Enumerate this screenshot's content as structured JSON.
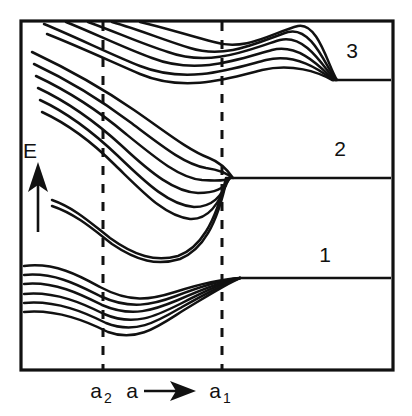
{
  "figure": {
    "type": "energy-band-splitting-diagram",
    "background_color": "#ffffff",
    "line_color": "#111111"
  },
  "axes": {
    "y_axis": {
      "label": "E",
      "description": "Energy increasing upward",
      "arrow_direction": "up"
    },
    "x_axis": {
      "label": "a",
      "description": "Interatomic spacing increasing to the right",
      "arrow_direction": "right",
      "ticks": [
        {
          "label": "a",
          "subscript": "2",
          "x": 103
        },
        {
          "label": "a",
          "subscript": "1",
          "x": 222
        }
      ]
    }
  },
  "band_labels": [
    {
      "text": "3",
      "x": 352,
      "y": 58
    },
    {
      "text": "2",
      "x": 340,
      "y": 156
    },
    {
      "text": "1",
      "x": 325,
      "y": 262
    }
  ],
  "markers": {
    "dashed_vertical_lines": [
      {
        "name": "a2",
        "x": 103
      },
      {
        "name": "a1",
        "x": 222
      }
    ]
  },
  "chart_data": {
    "type": "line",
    "title": "",
    "xlabel": "a",
    "ylabel": "E",
    "grid": false,
    "legend": "none",
    "plot_area": {
      "x0": 21,
      "y0": 21,
      "x1": 393,
      "y1": 370
    },
    "annotations": [
      {
        "text": "3",
        "x": 352,
        "y": 58
      },
      {
        "text": "2",
        "x": 340,
        "y": 156
      },
      {
        "text": "1",
        "x": 325,
        "y": 262
      },
      {
        "text": "a2",
        "x": 103,
        "y": 392
      },
      {
        "text": "a",
        "x": 140,
        "y": 392
      },
      {
        "text": "a1",
        "x": 222,
        "y": 392
      },
      {
        "text": "E",
        "x": 37,
        "y": 152
      }
    ],
    "series": [
      {
        "name": "band-1-level-1",
        "path": "M 24,266 C 55,262 80,276 100,287 C 130,303 150,300 175,292 C 200,284 222,279 240,278"
      },
      {
        "name": "band-1-level-2",
        "path": "M 24,275 C 55,272 80,286 100,296 C 130,310 152,305 176,296 C 202,286 222,280 240,278"
      },
      {
        "name": "band-1-level-3",
        "path": "M 24,284 C 55,281 82,295 102,305 C 132,318 154,310 178,300 C 203,289 223,281 240,278"
      },
      {
        "name": "band-1-level-4",
        "path": "M 24,294 C 56,291 84,304 104,314 C 134,327 156,316 180,304 C 205,291 224,282 240,278"
      },
      {
        "name": "band-1-level-5",
        "path": "M 24,303 C 57,300 86,313 106,323 C 136,335 158,321 182,307 C 207,293 225,283 240,278"
      },
      {
        "name": "band-1-level-6",
        "path": "M 24,312 C 58,309 88,322 108,332 C 138,343 160,325 184,310 C 209,295 226,284 240,278"
      },
      {
        "name": "band-2-lower-pair-a",
        "path": "M 52,200 C 75,208 92,224 110,238 C 135,256 155,262 178,256 C 200,248 215,224 226,178"
      },
      {
        "name": "band-2-lower-pair-b",
        "path": "M 52,206 C 76,214 94,230 112,244 C 137,261 157,266 180,259 C 202,250 217,226 227,178"
      },
      {
        "name": "band-2-level-1",
        "path": "M 42,112 C 70,125 95,145 115,165 C 145,194 165,216 190,219 C 208,220 220,204 228,178"
      },
      {
        "name": "band-2-level-2",
        "path": "M 40,100 C 70,114 96,135 118,156 C 148,185 170,205 194,207 C 212,207 222,197 229,178"
      },
      {
        "name": "band-2-level-3",
        "path": "M 38,88 C 70,103 98,124 122,146 C 152,174 175,192 198,193 C 215,193 224,189 230,178"
      },
      {
        "name": "band-2-level-4",
        "path": "M 36,76 C 70,92 100,112 126,134 C 158,160 180,178 202,180 C 218,181 226,181 231,178"
      },
      {
        "name": "band-2-level-5",
        "path": "M 34,64 C 70,81 102,101 130,122 C 162,146 184,164 206,168 C 220,170 228,174 232,178"
      },
      {
        "name": "band-2-level-6",
        "path": "M 32,52 C 70,70 105,90 134,110 C 166,132 188,150 209,158 C 222,163 229,172 233,178"
      },
      {
        "name": "band-3-level-1",
        "path": "M 47,34 C 80,47 112,62 140,74 C 185,93 230,78 262,70 C 292,63 318,72 332,80"
      },
      {
        "name": "band-3-level-2",
        "path": "M 44,24 C 78,38 110,54 140,66 C 188,85 235,68 266,60 C 296,53 320,70 333,80"
      },
      {
        "name": "band-3-level-3",
        "path": "M 66,22 C 96,34 124,48 152,58 C 198,76 242,58 272,50 C 300,43 322,69 334,80"
      },
      {
        "name": "band-3-level-4",
        "path": "M 88,22 C 116,32 142,44 168,52 C 212,68 252,48 280,40 C 306,34 324,68 335,80"
      },
      {
        "name": "band-3-level-5",
        "path": "M 112,22 C 140,30 164,40 190,48 C 228,60 262,40 288,32 C 312,26 326,67 336,80"
      },
      {
        "name": "band-3-level-6",
        "path": "M 140,22 C 166,28 190,36 214,42 C 246,52 274,32 298,26 C 318,22 328,66 337,80"
      }
    ],
    "flat_lines": [
      {
        "name": "band-3-asymptote",
        "x_start": 332,
        "x_end": 391,
        "y": 80
      },
      {
        "name": "band-2-asymptote",
        "x_start": 233,
        "x_end": 391,
        "y": 178
      },
      {
        "name": "band-1-asymptote",
        "x_start": 240,
        "x_end": 391,
        "y": 278
      }
    ]
  }
}
